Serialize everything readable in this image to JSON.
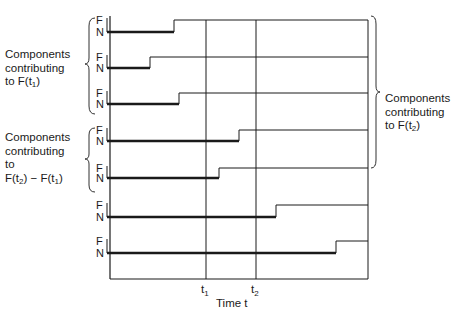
{
  "diagram": {
    "state_labels": {
      "functioning": "F",
      "failed": "N"
    },
    "x_axis_label": "Time t",
    "time_markers": [
      {
        "name": "t1",
        "label": "t",
        "sub": "1",
        "x": 206
      },
      {
        "name": "t2",
        "label": "t",
        "sub": "2",
        "x": 256
      }
    ],
    "components": [
      {
        "id": 1,
        "step_x": 174,
        "f_y": 20,
        "n_y": 32
      },
      {
        "id": 2,
        "step_x": 150,
        "f_y": 57,
        "n_y": 68
      },
      {
        "id": 3,
        "step_x": 179,
        "f_y": 93,
        "n_y": 104
      },
      {
        "id": 4,
        "step_x": 239,
        "f_y": 130,
        "n_y": 141
      },
      {
        "id": 5,
        "step_x": 219,
        "f_y": 168,
        "n_y": 178
      },
      {
        "id": 6,
        "step_x": 276,
        "f_y": 205,
        "n_y": 217
      },
      {
        "id": 7,
        "step_x": 336,
        "f_y": 241,
        "n_y": 253
      }
    ],
    "groups": {
      "left_top": {
        "lines": [
          "Components",
          "contributing",
          "to F(t"
        ],
        "sub": "1",
        "tail": ")"
      },
      "left_mid": {
        "lines": [
          "Components",
          "contributing",
          "to"
        ],
        "formula": "F(t",
        "sub_a": "2",
        "mid": ") − F(t",
        "sub_b": "1",
        "tail": ")"
      },
      "right": {
        "lines": [
          "Components",
          "contributing",
          "to F(t"
        ],
        "sub": "2",
        "tail": ")"
      }
    },
    "colors": {
      "ink": "#1a1a1a",
      "background": "#ffffff"
    }
  }
}
